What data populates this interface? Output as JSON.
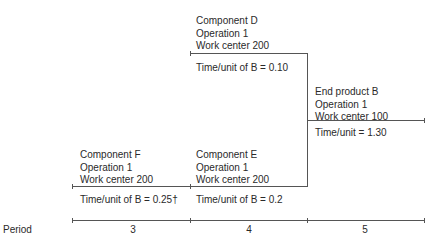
{
  "diagram": {
    "operations": [
      {
        "id": "component-d",
        "name": "Component D",
        "operation": "Operation 1",
        "work_center": "Work center 200",
        "time": "Time/unit of B = 0.10",
        "period": 4
      },
      {
        "id": "end-product-b",
        "name": "End product B",
        "operation": "Operation 1",
        "work_center": "Work center 100",
        "time": "Time/unit = 1.30",
        "period": 5
      },
      {
        "id": "component-f",
        "name": "Component F",
        "operation": "Operation 1",
        "work_center": "Work center 200",
        "time": "Time/unit of B = 0.25†",
        "period": 3
      },
      {
        "id": "component-e",
        "name": "Component E",
        "operation": "Operation 1",
        "work_center": "Work center 200",
        "time": "Time/unit of B = 0.2",
        "period": 4
      }
    ],
    "period_axis": {
      "label": "Period",
      "ticks": [
        "3",
        "4",
        "5"
      ]
    }
  }
}
